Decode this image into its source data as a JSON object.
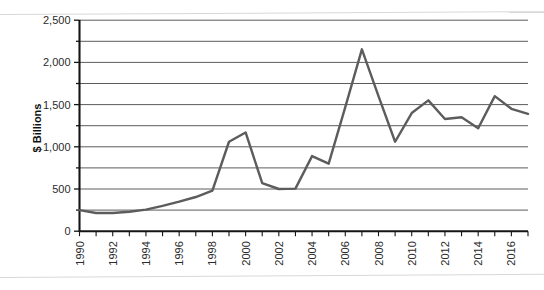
{
  "chart_data": {
    "type": "line",
    "title": "",
    "subtitle": "",
    "xlabel": "",
    "ylabel": "$ Billions",
    "ylim": [
      0,
      2500
    ],
    "xlim": [
      1990,
      2017
    ],
    "grid": true,
    "grid_interval": 250,
    "legend": false,
    "legend_position": "none",
    "y_ticks": [
      0,
      500,
      1000,
      1500,
      2000,
      2500
    ],
    "y_tick_labels": [
      "0",
      "500",
      "1,000",
      "1,500",
      "2,000",
      "2,500"
    ],
    "y_minor_ticks": [
      250,
      750,
      1250,
      1750,
      2250
    ],
    "x_ticks": [
      1990,
      1991,
      1992,
      1993,
      1994,
      1995,
      1996,
      1997,
      1998,
      1999,
      2000,
      2001,
      2002,
      2003,
      2004,
      2005,
      2006,
      2007,
      2008,
      2009,
      2010,
      2011,
      2012,
      2013,
      2014,
      2015,
      2016,
      2017
    ],
    "x_tick_labels": [
      "1990",
      "",
      "1992",
      "",
      "1994",
      "",
      "1996",
      "",
      "1998",
      "",
      "2000",
      "",
      "2002",
      "",
      "2004",
      "",
      "2006",
      "",
      "2008",
      "",
      "2010",
      "",
      "2012",
      "",
      "2014",
      "",
      "2016",
      ""
    ],
    "x": [
      1990,
      1991,
      1992,
      1993,
      1994,
      1995,
      1996,
      1997,
      1998,
      1999,
      2000,
      2001,
      2002,
      2003,
      2004,
      2005,
      2006,
      2007,
      2008,
      2009,
      2010,
      2011,
      2012,
      2013,
      2014,
      2015,
      2016,
      2017
    ],
    "categories": [
      "1990",
      "1991",
      "1992",
      "1993",
      "1994",
      "1995",
      "1996",
      "1997",
      "1998",
      "1999",
      "2000",
      "2001",
      "2002",
      "2003",
      "2004",
      "2005",
      "2006",
      "2007",
      "2008",
      "2009",
      "2010",
      "2011",
      "2012",
      "2013",
      "2014",
      "2015",
      "2016",
      "2017"
    ],
    "values": [
      250,
      215,
      215,
      230,
      255,
      300,
      350,
      405,
      480,
      1060,
      1170,
      570,
      500,
      505,
      890,
      800,
      1470,
      2155,
      1600,
      1060,
      1400,
      1550,
      1330,
      1350,
      1220,
      1600,
      1450,
      1390
    ],
    "series": [
      {
        "name": "",
        "color": "#5c5c5c",
        "values": [
          250,
          215,
          215,
          230,
          255,
          300,
          350,
          405,
          480,
          1060,
          1170,
          570,
          500,
          505,
          890,
          800,
          1470,
          2155,
          1600,
          1060,
          1400,
          1550,
          1330,
          1350,
          1220,
          1600,
          1450,
          1390
        ]
      }
    ],
    "annotations": []
  },
  "axes": {
    "y_axis_title": "$ Billions"
  },
  "colors": {
    "series_line": "#5c5c5c",
    "gridline": "#4a4a4a",
    "axis": "#141414",
    "page_rule": "#d8d8d8",
    "tick_label": "#2b2b2b"
  }
}
